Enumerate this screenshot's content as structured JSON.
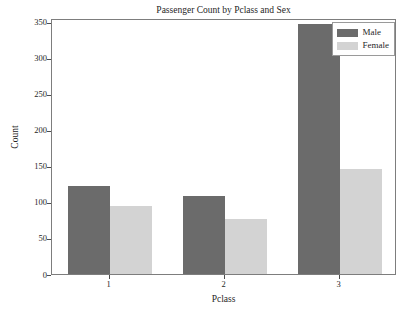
{
  "chart_data": {
    "type": "bar",
    "title": "Passenger Count by Pclass and Sex",
    "xlabel": "Pclass",
    "ylabel": "Count",
    "categories": [
      "1",
      "2",
      "3"
    ],
    "series": [
      {
        "name": "Male",
        "color": "#6b6b6b",
        "values": [
          122,
          108,
          347
        ]
      },
      {
        "name": "Female",
        "color": "#d3d3d3",
        "values": [
          94,
          76,
          146
        ]
      }
    ],
    "ylim": [
      0,
      355
    ],
    "yticks": [
      0,
      50,
      100,
      150,
      200,
      250,
      300,
      350
    ],
    "ytick_labels": [
      "0",
      "50",
      "100",
      "150",
      "200",
      "250",
      "300",
      "350"
    ],
    "grid": false,
    "legend_position": "upper right",
    "legend_entries": [
      "Male",
      "Female"
    ]
  },
  "footer": {
    "clipped_text": ""
  }
}
